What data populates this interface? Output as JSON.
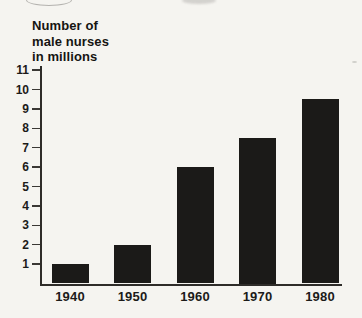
{
  "page": {
    "background_color": "#f5f4f0",
    "ink_color": "#1b1a18"
  },
  "chart_data": {
    "type": "bar",
    "title": "Number of male nurses in millions",
    "title_lines": [
      "Number of",
      "male nurses",
      "in millions"
    ],
    "categories": [
      "1940",
      "1950",
      "1960",
      "1970",
      "1980"
    ],
    "values": [
      1,
      2,
      6,
      7.5,
      9.5
    ],
    "xlabel": "",
    "ylabel": "Number of male nurses in millions",
    "ylim": [
      0,
      11
    ],
    "yticks": [
      1,
      2,
      3,
      4,
      5,
      6,
      7,
      8,
      9,
      10,
      11
    ],
    "grid": false,
    "legend_position": "none",
    "bar_color": "#1b1a18",
    "axis_color": "#2e2c29",
    "text_color": "#1c1b19"
  }
}
